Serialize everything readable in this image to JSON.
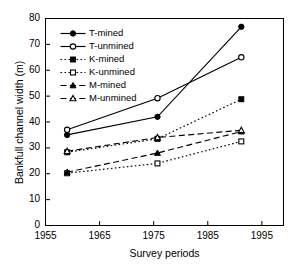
{
  "chart_data": {
    "type": "line",
    "title": "",
    "xlabel": "Survey periods",
    "ylabel": "Bankfull channel width (m)",
    "xlim": [
      1955,
      1999
    ],
    "ylim": [
      0,
      80
    ],
    "xticks": [
      1955,
      1965,
      1975,
      1985,
      1995
    ],
    "yticks": [
      0,
      10,
      20,
      30,
      40,
      50,
      60,
      70,
      80
    ],
    "grid": false,
    "legend_position": "upper-left-inside",
    "x": [
      1959,
      1975.7,
      1991.2
    ],
    "series": [
      {
        "name": "T-mined",
        "values": [
          35.0,
          42.0,
          76.8
        ],
        "marker": "filled-circle",
        "line": "solid"
      },
      {
        "name": "T-unmined",
        "values": [
          37.0,
          49.2,
          65.0
        ],
        "marker": "open-circle",
        "line": "solid"
      },
      {
        "name": "K-mined",
        "values": [
          28.3,
          33.5,
          48.8
        ],
        "marker": "filled-square",
        "line": "dotted"
      },
      {
        "name": "K-unmined",
        "values": [
          20.2,
          24.0,
          32.5
        ],
        "marker": "open-square",
        "line": "dotted"
      },
      {
        "name": "M-mined",
        "values": [
          20.6,
          28.0,
          36.3
        ],
        "marker": "filled-triangle",
        "line": "dashed"
      },
      {
        "name": "M-unmined",
        "values": [
          28.7,
          34.0,
          36.8
        ],
        "marker": "open-triangle",
        "line": "dashed"
      }
    ]
  },
  "legend": {
    "items": [
      {
        "label": "T-mined"
      },
      {
        "label": "T-unmined"
      },
      {
        "label": "K-mined"
      },
      {
        "label": "K-unmined"
      },
      {
        "label": "M-mined"
      },
      {
        "label": "M-unmined"
      }
    ]
  },
  "colors": {
    "ink": "#000000",
    "background": "#ffffff"
  }
}
